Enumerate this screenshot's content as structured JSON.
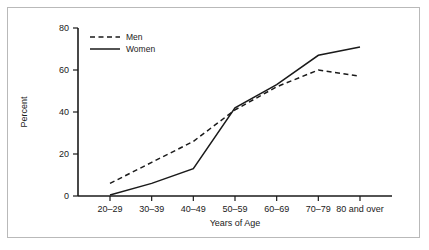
{
  "chart_data": {
    "type": "line",
    "title": "",
    "xlabel": "Years of Age",
    "ylabel": "Percent",
    "categories": [
      "20–29",
      "30–39",
      "40–49",
      "50–59",
      "60–69",
      "70–79",
      "80 and over"
    ],
    "yticks": [
      0,
      20,
      40,
      60,
      80
    ],
    "ytick_labels": [
      "0",
      "20",
      "40",
      "60",
      "80"
    ],
    "ylim": [
      0,
      80
    ],
    "grid": false,
    "legend_position": "upper-left-inside",
    "series": [
      {
        "name": "Men",
        "style": "dashed",
        "color": "#1a1a1a",
        "values": [
          6,
          16,
          26,
          41,
          52,
          60,
          57
        ]
      },
      {
        "name": "Women",
        "style": "solid",
        "color": "#1a1a1a",
        "values": [
          0.5,
          6,
          13,
          42,
          53,
          67,
          71
        ]
      }
    ]
  },
  "legend": {
    "men_label": "Men",
    "women_label": "Women"
  },
  "axes": {
    "y_title": "Percent",
    "x_title": "Years of Age"
  },
  "colors": {
    "line": "#1a1a1a",
    "axis": "#1a1a1a",
    "border": "#b9b9b9",
    "background": "#ffffff"
  }
}
